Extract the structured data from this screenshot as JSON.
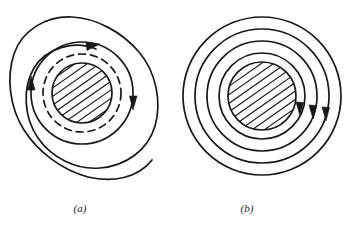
{
  "figure": {
    "background_color": "#ffffff",
    "ink_color": "#17181a",
    "panels": [
      {
        "id": "a",
        "label": "(a)",
        "label_x": 80,
        "label_y": 212,
        "center_x": 82,
        "center_y": 93,
        "core": {
          "name": "hatched-core",
          "radius": 30,
          "hatch_angle_deg": -35,
          "hatch_count": 9,
          "hatch_spacing": 7
        },
        "rings": [
          {
            "name": "dashed-flux-ring",
            "radius": 39,
            "style": "dashed",
            "dash_pattern": "7 5",
            "stroke_width": 1.7,
            "arrows": []
          },
          {
            "name": "inner-solid-field-line",
            "radius": 51,
            "style": "solid",
            "stroke_width": 1.7,
            "arrows": [
              {
                "name": "arrow-left-up",
                "angle_deg": 180,
                "direction": "up"
              },
              {
                "name": "arrow-right-down",
                "angle_deg": 0,
                "direction": "down"
              }
            ]
          }
        ],
        "spiral": {
          "name": "outer-spiral-field-line",
          "stroke_width": 1.7,
          "start_radius": 44,
          "end_radius": 81,
          "arrow": {
            "name": "arrow-spiral-top",
            "direction": "clockwise"
          }
        }
      },
      {
        "id": "b",
        "label": "(b)",
        "label_x": 247,
        "label_y": 212,
        "center_x": 262,
        "center_y": 96,
        "core": {
          "name": "hatched-core",
          "radius": 34,
          "hatch_angle_deg": -35,
          "hatch_count": 10,
          "hatch_spacing": 7
        },
        "rings": [
          {
            "name": "field-line-ring-1",
            "radius": 43,
            "style": "solid",
            "stroke_width": 1.7,
            "arrows": [
              {
                "name": "arrow-ring-1-down",
                "angle_deg": -28,
                "direction": "down"
              }
            ]
          },
          {
            "name": "field-line-ring-2",
            "radius": 55,
            "style": "solid",
            "stroke_width": 1.7,
            "arrows": [
              {
                "name": "arrow-ring-2-down",
                "angle_deg": -23,
                "direction": "down"
              }
            ]
          },
          {
            "name": "field-line-ring-3",
            "radius": 67,
            "style": "solid",
            "stroke_width": 1.7,
            "arrows": [
              {
                "name": "arrow-ring-3-down",
                "angle_deg": -19,
                "direction": "down"
              }
            ]
          },
          {
            "name": "field-line-ring-4",
            "radius": 79,
            "style": "solid",
            "stroke_width": 1.7,
            "arrows": []
          }
        ]
      }
    ]
  }
}
